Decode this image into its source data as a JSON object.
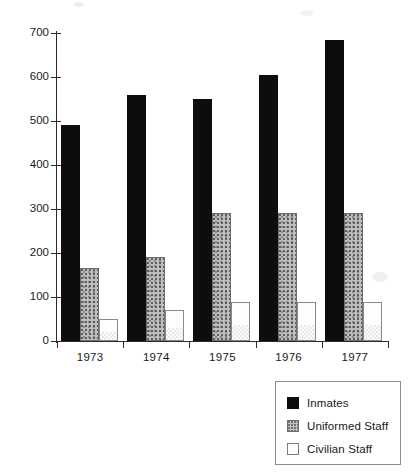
{
  "chart_data": {
    "type": "bar",
    "title": "",
    "subtitle": "",
    "xlabel": "",
    "ylabel": "",
    "categories": [
      "1973",
      "1974",
      "1975",
      "1976",
      "1977"
    ],
    "series": [
      {
        "name": "Inmates",
        "key": "inmates",
        "color": "#0d0d0d",
        "fill": "solid-black",
        "values": [
          490,
          560,
          550,
          605,
          685
        ]
      },
      {
        "name": "Uniformed Staff",
        "key": "uniformed",
        "color": "#bdbdbd",
        "fill": "stippled-gray",
        "values": [
          165,
          190,
          290,
          290,
          290
        ]
      },
      {
        "name": "Civilian Staff",
        "key": "civilian",
        "color": "#ffffff",
        "fill": "white-outline",
        "values": [
          50,
          70,
          88,
          88,
          88
        ]
      }
    ],
    "ylim": [
      0,
      700
    ],
    "yticks": [
      0,
      100,
      200,
      300,
      400,
      500,
      600,
      700
    ],
    "ytick_labels": [
      "0",
      "100",
      "200",
      "300",
      "400",
      "500",
      "600",
      "700"
    ],
    "grid": false,
    "legend_position": "bottom-right",
    "axis_color": "#2b2b2b"
  },
  "legend": {
    "items": [
      {
        "label": "Inmates"
      },
      {
        "label": "Uniformed Staff"
      },
      {
        "label": "Civilian Staff"
      }
    ]
  }
}
